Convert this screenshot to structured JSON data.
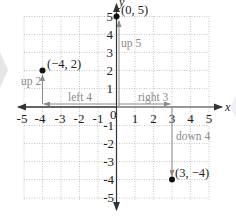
{
  "diagram": {
    "type": "coordinate-plane",
    "axes": {
      "x_label": "x",
      "y_label": "y",
      "x_range": [
        -5,
        5
      ],
      "y_range": [
        -5,
        5
      ],
      "origin_label": "0"
    },
    "x_ticks": [
      "-5",
      "-4",
      "-3",
      "-2",
      "-1",
      "1",
      "2",
      "3",
      "4",
      "5"
    ],
    "y_ticks": [
      "5",
      "4",
      "3",
      "2",
      "1",
      "-1",
      "-2",
      "-3",
      "-4",
      "-5"
    ],
    "points": [
      {
        "label": "(0, 5)",
        "x": 0,
        "y": 5
      },
      {
        "label": "(−4, 2)",
        "x": -4,
        "y": 2
      },
      {
        "label": "(3, −4)",
        "x": 3,
        "y": -4
      }
    ],
    "moves": [
      {
        "label": "left 4",
        "direction": "left"
      },
      {
        "label": "up 2",
        "direction": "up"
      },
      {
        "label": "up 5",
        "direction": "up"
      },
      {
        "label": "right 3",
        "direction": "right"
      },
      {
        "label": "down 4",
        "direction": "down"
      }
    ],
    "colors": {
      "grid": "#b8b8b8",
      "axis": "#333333",
      "move_arrow": "#8a8a8a",
      "point": "#111111"
    }
  }
}
